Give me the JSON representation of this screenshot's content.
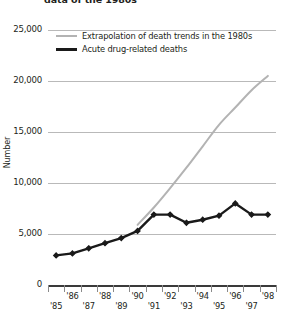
{
  "chart_data": {
    "type": "line",
    "title": "data of the 1980s",
    "xlabel": "",
    "ylabel": "Number",
    "ylim": [
      0,
      25000
    ],
    "yticks": [
      0,
      5000,
      10000,
      15000,
      20000,
      25000
    ],
    "ytick_labels": [
      "0",
      "5,000",
      "10,000",
      "15,000",
      "20,000",
      "25,000"
    ],
    "grid": true,
    "legend_position": "top-left",
    "categories": [
      "'85",
      "'86",
      "'87",
      "'88",
      "'89",
      "'90",
      "'91",
      "'92",
      "'93",
      "'94",
      "'95",
      "'96",
      "'97",
      "'98"
    ],
    "xtick_labels": [
      "'85",
      "'86",
      "'87",
      "'88",
      "'89",
      "'90",
      "'91",
      "'92",
      "'93",
      "'94",
      "'95",
      "'96",
      "'97",
      "'98"
    ],
    "series": [
      {
        "name": "Extrapolation of death trends in the 1980s",
        "color": "#b3b3b3",
        "markers": false,
        "x": [
          "'90",
          "'91",
          "'92",
          "'93",
          "'94",
          "'95",
          "'96",
          "'97",
          "'98"
        ],
        "values": [
          5900,
          7600,
          9500,
          11500,
          13600,
          15700,
          17400,
          19100,
          20500
        ]
      },
      {
        "name": "Acute drug-related deaths",
        "color": "#1a1a1a",
        "markers": true,
        "x": [
          "'85",
          "'86",
          "'87",
          "'88",
          "'89",
          "'90",
          "'91",
          "'92",
          "'93",
          "'94",
          "'95",
          "'96",
          "'97",
          "'98"
        ],
        "values": [
          2900,
          3100,
          3600,
          4100,
          4600,
          5300,
          6900,
          6900,
          6100,
          6400,
          6800,
          8000,
          6900,
          6900
        ]
      }
    ]
  },
  "legend": {
    "items": [
      {
        "label": "Extrapolation of death trends in the 1980s",
        "style": "gray"
      },
      {
        "label": "Acute drug-related deaths",
        "style": "black"
      }
    ]
  }
}
